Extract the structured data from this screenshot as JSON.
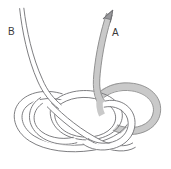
{
  "diagram": {
    "type": "knot-tying-illustration",
    "title": "",
    "background_color": "#ffffff",
    "width": 171,
    "height": 169,
    "labels": [
      {
        "id": "B",
        "text": "B",
        "x": 8,
        "y": 27,
        "describes": "free-end-strand-left"
      },
      {
        "id": "A",
        "text": "A",
        "x": 112,
        "y": 28,
        "describes": "working-end-strand-right-with-arrow"
      }
    ],
    "strands": [
      {
        "name": "working-strand-a",
        "shading": "gray-filled",
        "fill_color": "#c9c9c9",
        "stroke_color": "#8a8a8a",
        "has_arrow": true,
        "arrow_direction": "up-right",
        "arrow_tip": {
          "x": 112,
          "y": 11
        }
      },
      {
        "name": "standing-strand-b",
        "shading": "white-outline",
        "fill_color": "#ffffff",
        "stroke_color": "#77777a",
        "has_arrow": false
      }
    ],
    "knot_bounds": {
      "x": 18,
      "y": 86,
      "width": 140,
      "height": 66
    },
    "colors": {
      "line": "#77777a",
      "gray_fill": "#c9c9c9",
      "gray_stroke": "#8d8d8d",
      "label": "#3a3a3a",
      "background": "#ffffff"
    }
  }
}
